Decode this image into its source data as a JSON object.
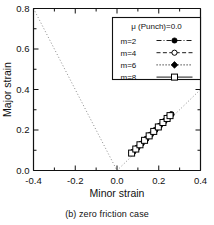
{
  "figure": {
    "caption": "(b) zero friction case"
  },
  "chart_data": {
    "type": "scatter",
    "title": "",
    "xlabel": "Minor strain",
    "ylabel": "Major strain",
    "xlim": [
      -0.4,
      0.4
    ],
    "ylim": [
      0.0,
      0.8
    ],
    "xticks": [
      -0.4,
      -0.2,
      0.0,
      0.2,
      0.4
    ],
    "xticklabels": [
      "-0.4",
      "-0.2",
      "0.0",
      "0.2",
      "0.4"
    ],
    "yticks": [
      0.0,
      0.2,
      0.4,
      0.6,
      0.8
    ],
    "yticklabels": [
      "0.0",
      "0.2",
      "0.4",
      "0.6",
      "0.8"
    ],
    "minor_tick_step": 0.1,
    "grid": false,
    "legend": {
      "position": "upper-right",
      "title": "μ (Punch)=0.0",
      "entries": [
        {
          "label": "m=2",
          "marker": "filled-circle",
          "line": "dash-dot",
          "color": "#000000"
        },
        {
          "label": "m=4",
          "marker": "open-circle",
          "line": "dashed",
          "color": "#000000"
        },
        {
          "label": "m=6",
          "marker": "filled-diamond",
          "line": "dotted",
          "color": "#000000"
        },
        {
          "label": "m=8",
          "marker": "open-square",
          "line": "solid",
          "color": "#000000"
        }
      ]
    },
    "reference_lines": [
      {
        "name": "uniaxial-tension-line",
        "style": "dotted",
        "color": "#8a8a8a",
        "points": [
          [
            -0.4,
            0.8
          ],
          [
            0.0,
            0.0
          ]
        ]
      },
      {
        "name": "equi-biaxial-line",
        "style": "dotted",
        "color": "#8a8a8a",
        "points": [
          [
            0.0,
            0.0
          ],
          [
            0.4,
            0.4
          ]
        ]
      }
    ],
    "series": [
      {
        "name": "m=2",
        "marker": "filled-circle",
        "line": "dash-dot",
        "x": [
          0.078,
          0.098,
          0.118,
          0.14,
          0.162,
          0.183,
          0.205,
          0.228,
          0.248,
          0.261
        ],
        "y": [
          0.092,
          0.112,
          0.133,
          0.155,
          0.177,
          0.199,
          0.221,
          0.244,
          0.265,
          0.278
        ]
      },
      {
        "name": "m=4",
        "marker": "open-circle",
        "line": "dashed",
        "x": [
          0.074,
          0.095,
          0.115,
          0.137,
          0.159,
          0.18,
          0.202,
          0.225,
          0.245,
          0.258
        ],
        "y": [
          0.09,
          0.11,
          0.131,
          0.153,
          0.175,
          0.197,
          0.219,
          0.242,
          0.262,
          0.275
        ]
      },
      {
        "name": "m=6",
        "marker": "filled-diamond",
        "line": "dotted",
        "x": [
          0.072,
          0.092,
          0.113,
          0.134,
          0.156,
          0.178,
          0.2,
          0.222,
          0.242,
          0.256
        ],
        "y": [
          0.088,
          0.108,
          0.129,
          0.151,
          0.173,
          0.195,
          0.217,
          0.239,
          0.259,
          0.273
        ]
      },
      {
        "name": "m=8",
        "marker": "open-square",
        "line": "solid",
        "x": [
          0.07,
          0.09,
          0.11,
          0.132,
          0.154,
          0.176,
          0.198,
          0.22,
          0.24,
          0.254
        ],
        "y": [
          0.086,
          0.106,
          0.127,
          0.149,
          0.171,
          0.193,
          0.215,
          0.237,
          0.257,
          0.271
        ]
      }
    ]
  }
}
